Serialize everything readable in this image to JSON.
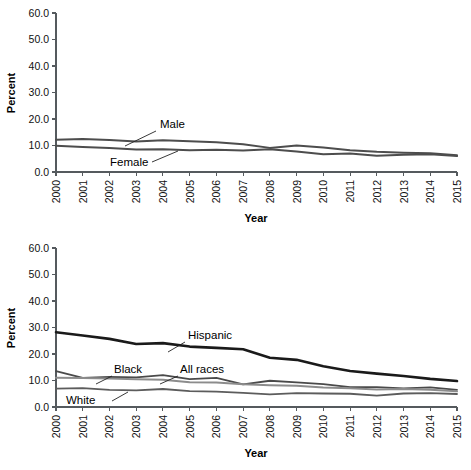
{
  "figure": {
    "width": 471,
    "height": 470,
    "background": "#ffffff"
  },
  "chart_data": [
    {
      "type": "line",
      "panel": "top",
      "title": "",
      "xlabel": "Year",
      "ylabel": "Percent",
      "x": [
        2000,
        2001,
        2002,
        2003,
        2004,
        2005,
        2006,
        2007,
        2008,
        2009,
        2010,
        2011,
        2012,
        2013,
        2014,
        2015
      ],
      "categories": [
        "2000",
        "2001",
        "2002",
        "2003",
        "2004",
        "2005",
        "2006",
        "2007",
        "2008",
        "2009",
        "2010",
        "2011",
        "2012",
        "2013",
        "2014",
        "2015"
      ],
      "xlim": [
        2000,
        2015
      ],
      "ylim": [
        0.0,
        60.0
      ],
      "yticks": [
        "0.0",
        "10.0",
        "20.0",
        "30.0",
        "40.0",
        "50.0",
        "60.0"
      ],
      "ytick_values": [
        0.0,
        10.0,
        20.0,
        30.0,
        40.0,
        50.0,
        60.0
      ],
      "grid": false,
      "legend_position": "inline-annotations",
      "series": [
        {
          "name": "Male",
          "color": "#4d4d4d",
          "width": 2.0,
          "values": [
            12.2,
            12.5,
            12.1,
            11.5,
            12.0,
            11.6,
            11.2,
            10.5,
            9.1,
            10.0,
            9.2,
            8.2,
            7.6,
            7.3,
            7.1,
            6.3
          ]
        },
        {
          "name": "Female",
          "color": "#4d4d4d",
          "width": 2.0,
          "values": [
            9.9,
            9.4,
            9.1,
            8.5,
            8.6,
            8.2,
            8.4,
            8.1,
            8.6,
            7.7,
            6.7,
            7.0,
            6.1,
            6.5,
            6.7,
            6.0
          ]
        }
      ],
      "annotations": [
        {
          "text": "Male",
          "x_px": 160,
          "y_px": 128,
          "leader_from_px": [
            156,
            131
          ],
          "leader_to_px": [
            125,
            146
          ]
        },
        {
          "text": "Female",
          "x_px": 110,
          "y_px": 166,
          "leader_from_px": [
            152,
            162
          ],
          "leader_to_px": [
            178,
            151
          ]
        }
      ]
    },
    {
      "type": "line",
      "panel": "bottom",
      "title": "",
      "xlabel": "Year",
      "ylabel": "Percent",
      "x": [
        2000,
        2001,
        2002,
        2003,
        2004,
        2005,
        2006,
        2007,
        2008,
        2009,
        2010,
        2011,
        2012,
        2013,
        2014,
        2015
      ],
      "categories": [
        "2000",
        "2001",
        "2002",
        "2003",
        "2004",
        "2005",
        "2006",
        "2007",
        "2008",
        "2009",
        "2010",
        "2011",
        "2012",
        "2013",
        "2014",
        "2015"
      ],
      "xlim": [
        2000,
        2015
      ],
      "ylim": [
        0.0,
        60.0
      ],
      "yticks": [
        "0.0",
        "10.0",
        "20.0",
        "30.0",
        "40.0",
        "50.0",
        "60.0"
      ],
      "ytick_values": [
        0.0,
        10.0,
        20.0,
        30.0,
        40.0,
        50.0,
        60.0
      ],
      "grid": false,
      "legend_position": "inline-annotations",
      "series": [
        {
          "name": "Hispanic",
          "color": "#1a1a1a",
          "width": 2.6,
          "values": [
            28.2,
            27.0,
            25.7,
            23.8,
            24.1,
            22.8,
            22.3,
            21.8,
            18.6,
            17.8,
            15.4,
            13.6,
            12.6,
            11.7,
            10.6,
            9.8
          ]
        },
        {
          "name": "Black",
          "color": "#4a4a4a",
          "width": 1.8,
          "values": [
            13.5,
            11.0,
            11.4,
            11.2,
            12.0,
            10.5,
            11.0,
            8.5,
            9.9,
            9.3,
            8.6,
            7.5,
            7.5,
            7.0,
            7.4,
            6.5
          ]
        },
        {
          "name": "All races",
          "color": "#8c8c8c",
          "width": 2.0,
          "values": [
            11.0,
            10.9,
            10.8,
            10.5,
            10.3,
            9.3,
            9.2,
            8.6,
            8.2,
            8.0,
            7.4,
            7.1,
            6.6,
            6.8,
            6.5,
            5.9
          ]
        },
        {
          "name": "White",
          "color": "#5c5c5c",
          "width": 1.8,
          "values": [
            6.9,
            7.1,
            6.5,
            6.3,
            6.8,
            6.0,
            5.8,
            5.3,
            4.8,
            5.2,
            5.1,
            5.0,
            4.3,
            5.1,
            5.2,
            4.9
          ]
        }
      ],
      "annotations": [
        {
          "text": "Hispanic",
          "x_px": 188,
          "y_px": 339,
          "leader_from_px": [
            185,
            342
          ],
          "leader_to_px": [
            168,
            352
          ]
        },
        {
          "text": "Black",
          "x_px": 114,
          "y_px": 373,
          "leader_from_px": [
            112,
            376
          ],
          "leader_to_px": [
            96,
            384
          ]
        },
        {
          "text": "All races",
          "x_px": 180,
          "y_px": 373,
          "leader_from_px": [
            178,
            376
          ],
          "leader_to_px": [
            160,
            384
          ]
        },
        {
          "text": "White",
          "x_px": 66,
          "y_px": 404,
          "leader_from_px": [
            112,
            401
          ],
          "leader_to_px": [
            128,
            392
          ]
        }
      ]
    }
  ]
}
